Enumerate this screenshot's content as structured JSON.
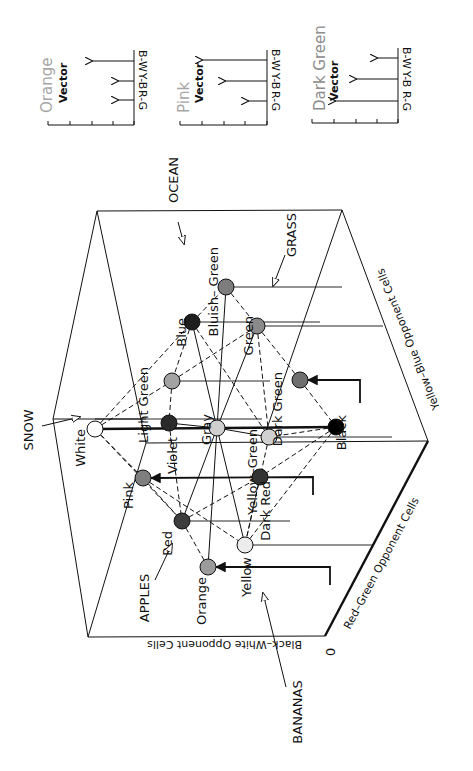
{
  "figure": {
    "vector_panels": [
      {
        "id": "orange",
        "title": "Orange",
        "subtitle": "Vector",
        "title_color": "#a6a6a6",
        "axis_x": 134,
        "axis_top": 50,
        "baseline_y": 125,
        "baseline_left": 48,
        "ticks": [
          48,
          70,
          92,
          113,
          134
        ],
        "title_x": 40,
        "sub_x": 58,
        "arrows": [
          {
            "channel": "B-W",
            "y": 61,
            "length": 42
          },
          {
            "channel": "Y-B",
            "y": 81,
            "length": 16
          },
          {
            "channel": "R-G",
            "y": 100,
            "length": 16
          }
        ]
      },
      {
        "id": "pink",
        "title": "Pink",
        "subtitle": "Vector",
        "title_color": "#a6a6a6",
        "axis_x": 267,
        "axis_top": 50,
        "baseline_y": 125,
        "baseline_left": 180,
        "ticks": [
          180,
          202,
          224,
          245,
          267
        ],
        "title_x": 177,
        "sub_x": 194,
        "arrows": [
          {
            "channel": "B-W",
            "y": 60,
            "length": 65
          },
          {
            "channel": "Y-B",
            "y": 81,
            "length": 42
          },
          {
            "channel": "R-G",
            "y": 101,
            "length": 19
          }
        ]
      },
      {
        "id": "dark-green",
        "title": "Dark Green",
        "subtitle": "Vector",
        "title_color": "#8c8c8c",
        "axis_x": 398,
        "axis_top": 48,
        "baseline_y": 123,
        "baseline_left": 312,
        "ticks": [
          312,
          334,
          356,
          377,
          398
        ],
        "title_x": 313,
        "sub_x": 329,
        "arrows": [
          {
            "channel": "B-W",
            "y": 58,
            "length": 21
          },
          {
            "channel": "Y-B",
            "y": 79,
            "length": 42
          },
          {
            "channel": "R-G",
            "y": 101,
            "length": 63
          }
        ]
      }
    ],
    "cube": {
      "edges": [
        [
          97,
          211,
          342,
          210
        ],
        [
          97,
          211,
          53,
          419
        ],
        [
          97,
          211,
          146,
          443
        ],
        [
          342,
          210,
          428,
          441
        ],
        [
          342,
          210,
          262,
          443
        ],
        [
          53,
          419,
          88,
          637
        ],
        [
          53,
          419,
          146,
          419
        ],
        [
          146,
          443,
          88,
          637
        ],
        [
          146,
          443,
          428,
          441
        ],
        [
          88,
          637,
          325,
          636
        ],
        [
          428,
          441,
          325,
          636
        ]
      ],
      "thick_edges": [
        [
          325,
          636,
          428,
          441
        ]
      ],
      "origin_label": "0",
      "axes": {
        "black_white": "Black–White Opponent Cells",
        "red_green": "Red–Green Opponent Cells",
        "yellow_blue": "Yellow–Blue Opponent Cells"
      }
    },
    "colors": [
      {
        "name": "White",
        "label": "White",
        "x": 95,
        "y": 429,
        "fill": "#ffffff",
        "r": 8
      },
      {
        "name": "Violet",
        "label": "Violet",
        "x": 169,
        "y": 423,
        "fill": "#2a2a2a",
        "r": 8
      },
      {
        "name": "Gray",
        "label": "Gray",
        "x": 217,
        "y": 428,
        "fill": "#cfcfcf",
        "r": 8
      },
      {
        "name": "Black",
        "label": "Black",
        "x": 336,
        "y": 427,
        "fill": "#000000",
        "r": 8
      },
      {
        "name": "Yellow-Green",
        "label": "Yellow–Green",
        "x": 269,
        "y": 437,
        "fill": "#d0d0d0",
        "r": 8
      },
      {
        "name": "Blue",
        "label": "Blue",
        "x": 192,
        "y": 322,
        "fill": "#1e1e1e",
        "r": 8
      },
      {
        "name": "Bluish-Green",
        "label": "Bluish– Green",
        "x": 226,
        "y": 287,
        "fill": "#7d7d7d",
        "r": 8
      },
      {
        "name": "Green",
        "label": "Green",
        "x": 257,
        "y": 326,
        "fill": "#8a8a8a",
        "r": 8
      },
      {
        "name": "Light Green",
        "label": "Light  Green",
        "x": 172,
        "y": 381,
        "fill": "#a3a3a3",
        "r": 8
      },
      {
        "name": "Dark Green",
        "label": "Dark  Green",
        "x": 300,
        "y": 380,
        "fill": "#6f6f6f",
        "r": 8
      },
      {
        "name": "Pink",
        "label": "Pink",
        "x": 143,
        "y": 478,
        "fill": "#7e7e7e",
        "r": 8
      },
      {
        "name": "Dark Red",
        "label": "Dark  Red",
        "x": 260,
        "y": 477,
        "fill": "#333333",
        "r": 8
      },
      {
        "name": "Red",
        "label": "Red",
        "x": 182,
        "y": 521,
        "fill": "#3d3d3d",
        "r": 8
      },
      {
        "name": "Yellow",
        "label": "Yellow",
        "x": 245,
        "y": 545,
        "fill": "#ececec",
        "r": 8
      },
      {
        "name": "Orange",
        "label": "Orange",
        "x": 208,
        "y": 567,
        "fill": "#9b9b9b",
        "r": 8
      }
    ],
    "solid_links": [
      [
        "White",
        "Black",
        2.5
      ],
      [
        "Gray",
        "Blue",
        1
      ],
      [
        "Gray",
        "Bluish-Green",
        1
      ],
      [
        "Gray",
        "Green",
        1
      ],
      [
        "Gray",
        "Red",
        1
      ],
      [
        "Gray",
        "Orange",
        1
      ],
      [
        "Gray",
        "Yellow",
        1
      ],
      [
        "Gray",
        "Violet",
        1
      ],
      [
        "Gray",
        "Yellow-Green",
        1
      ]
    ],
    "dashed_links": [
      [
        "White",
        "Blue"
      ],
      [
        "White",
        "Light Green"
      ],
      [
        "White",
        "Pink"
      ],
      [
        "White",
        "Red"
      ],
      [
        "Blue",
        "Light Green"
      ],
      [
        "Blue",
        "Bluish-Green"
      ],
      [
        "Bluish-Green",
        "Green"
      ],
      [
        "Blue",
        "Yellow-Green"
      ],
      [
        "Green",
        "Light Green"
      ],
      [
        "Green",
        "Dark Green"
      ],
      [
        "Green",
        "Yellow-Green"
      ],
      [
        "Light Green",
        "Violet"
      ],
      [
        "Dark Green",
        "Black"
      ],
      [
        "Black",
        "Yellow-Green"
      ],
      [
        "Black",
        "Dark Red"
      ],
      [
        "Black",
        "Yellow"
      ],
      [
        "Pink",
        "Red"
      ],
      [
        "Pink",
        "Yellow"
      ],
      [
        "Red",
        "Dark Red"
      ],
      [
        "Red",
        "Orange"
      ],
      [
        "Dark Red",
        "Yellow"
      ],
      [
        "Violet",
        "Red"
      ],
      [
        "Yellow-Green",
        "Yellow"
      ]
    ],
    "projection_lines": [
      [
        226,
        287,
        342,
        287
      ],
      [
        192,
        322,
        320,
        322
      ],
      [
        257,
        326,
        383,
        326
      ],
      [
        172,
        381,
        270,
        381
      ],
      [
        95,
        419,
        262,
        419
      ],
      [
        269,
        437,
        392,
        437
      ],
      [
        182,
        521,
        290,
        521
      ],
      [
        245,
        545,
        372,
        545
      ]
    ],
    "vector_arrows": [
      {
        "from": [
          360,
          403,
          360,
          380
        ],
        "to_x": 308,
        "head_at": [
          308,
          380
        ],
        "label": "Dark Green path"
      },
      {
        "from": [
          313,
          495,
          313,
          477
        ],
        "to_x": 151,
        "head_at": [
          151,
          478
        ],
        "label": "Pink path"
      },
      {
        "from": [
          330,
          585,
          330,
          567
        ],
        "to_x": 216,
        "head_at": [
          216,
          567
        ],
        "label": "Orange path"
      }
    ],
    "object_labels": [
      {
        "text": "SNOW",
        "x": 33,
        "y": 430,
        "arrow": [
          42,
          426,
          80,
          417
        ]
      },
      {
        "text": "OCEAN",
        "x": 178,
        "y": 180,
        "arrow": [
          178,
          222,
          184,
          244
        ]
      },
      {
        "text": "GRASS",
        "x": 296,
        "y": 235,
        "arrow": [
          285,
          255,
          273,
          286
        ]
      },
      {
        "text": "APPLES",
        "x": 149,
        "y": 598,
        "arrow": [
          155,
          580,
          172,
          544
        ]
      },
      {
        "text": "BANANAS",
        "x": 302,
        "y": 712,
        "arrow": [
          286,
          687,
          263,
          593
        ]
      }
    ]
  }
}
